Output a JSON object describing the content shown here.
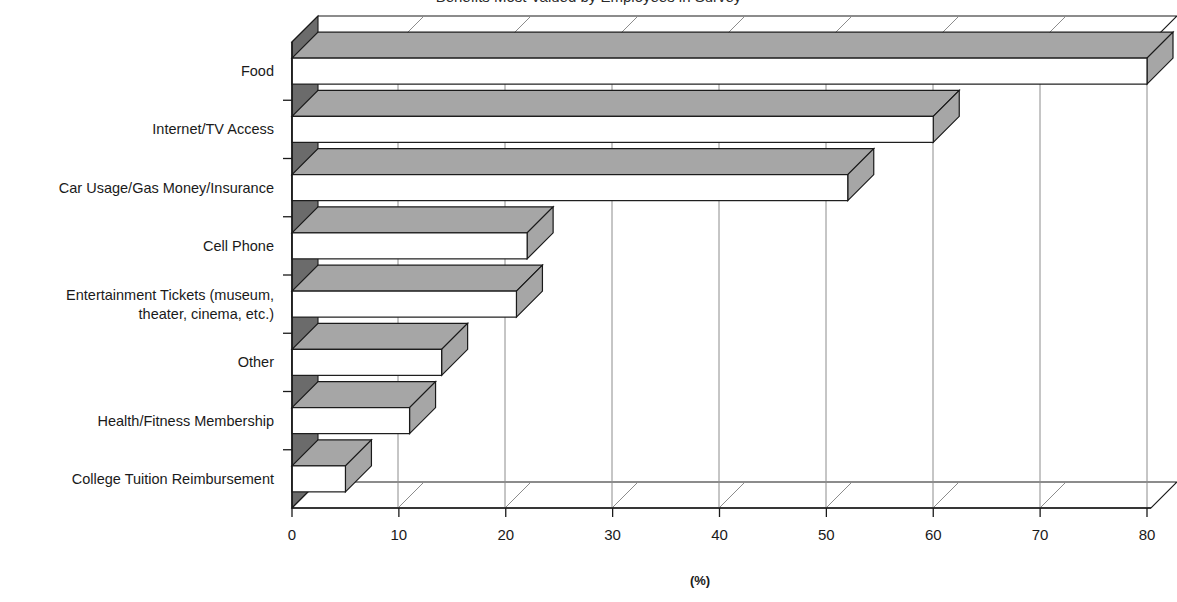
{
  "chart_data": {
    "type": "bar",
    "orientation": "horizontal",
    "title": "Benefits Most Valued by Employees in Survey",
    "title_visible": false,
    "categories": [
      "Food",
      "Internet/TV Access",
      "Car Usage/Gas Money/Insurance",
      "Cell Phone",
      "Entertainment Tickets (museum, theater, cinema, etc.)",
      "Other",
      "Health/Fitness Membership",
      "College Tuition Reimbursement"
    ],
    "category_lines": [
      [
        "Food"
      ],
      [
        "Internet/TV Access"
      ],
      [
        "Car Usage/Gas Money/Insurance"
      ],
      [
        "Cell Phone"
      ],
      [
        "Entertainment Tickets (museum,",
        "theater, cinema, etc.)"
      ],
      [
        "Other"
      ],
      [
        "Health/Fitness Membership"
      ],
      [
        "College Tuition Reimbursement"
      ]
    ],
    "values": [
      80,
      60,
      52,
      22,
      21,
      14,
      11,
      5
    ],
    "xlabel": "(%)",
    "ylabel": "",
    "xlim": [
      0,
      80
    ],
    "xticks": [
      0,
      10,
      20,
      30,
      40,
      50,
      60,
      70,
      80
    ],
    "xtick_labels": [
      "0",
      "10",
      "20",
      "30",
      "40",
      "50",
      "60",
      "70",
      "80"
    ],
    "grid": true,
    "grid_axis": "x",
    "legend": false,
    "style": "3d",
    "colors": {
      "bar_face": "#ffffff",
      "bar_shade": "#a6a6a6",
      "bar_outline": "#1a1a1a",
      "wall": "#6b6b6b",
      "grid": "#8c8c8c",
      "axis": "#1a1a1a",
      "background": "#ffffff",
      "text": "#1a1a1a"
    }
  }
}
